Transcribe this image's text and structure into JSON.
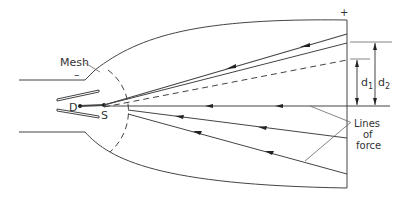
{
  "diagram": {
    "labels": {
      "mesh": "Mesh",
      "minus": "–",
      "plus": "+",
      "d_point": "D",
      "s_point": "S",
      "d1": "d",
      "d1_sub": "1",
      "d2": "d",
      "d2_sub": "2",
      "lines_of_force_1": "Lines",
      "lines_of_force_2": "of",
      "lines_of_force_3": "force"
    },
    "colors": {
      "line": "#444444",
      "text": "#333333",
      "background": "#ffffff"
    }
  }
}
